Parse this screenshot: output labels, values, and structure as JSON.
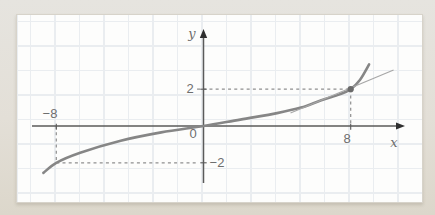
{
  "colors": {
    "background": "#e3dfd7",
    "panel": "#fdfdfc",
    "grid": "#eaedf0",
    "axis": "#5a5a5a",
    "arrow": "#2f2f2f",
    "curve": "#868686",
    "tangent": "#a7a7a7",
    "dashed": "#8f8f8f",
    "point": "#6a6a6a",
    "text": "#6e6e6e"
  },
  "chart_data": {
    "type": "line",
    "xlabel": "x",
    "ylabel": "y",
    "origin_label": "0",
    "grid": true,
    "xlim": [
      -9.3,
      11
    ],
    "ylim": [
      -3.2,
      5.3
    ],
    "x_ticks": [
      {
        "value": -8,
        "label": "−8"
      },
      {
        "value": 8,
        "label": "8"
      }
    ],
    "y_ticks": [
      {
        "value": 2,
        "label": "2"
      },
      {
        "value": -2,
        "label": "−2"
      }
    ],
    "series": [
      {
        "name": "curve",
        "style": "smooth",
        "points": [
          [
            -8.7,
            -2.55
          ],
          [
            -8,
            -2
          ],
          [
            -6.7,
            -1.45
          ],
          [
            -4.5,
            -0.8
          ],
          [
            -2.3,
            -0.35
          ],
          [
            0,
            0
          ],
          [
            2,
            0.35
          ],
          [
            4,
            0.7
          ],
          [
            5.3,
            1.0
          ],
          [
            6.4,
            1.4
          ],
          [
            7.4,
            1.72
          ],
          [
            8,
            2
          ],
          [
            8.5,
            2.5
          ],
          [
            9,
            3.35
          ]
        ]
      },
      {
        "name": "tangent-line",
        "style": "straight",
        "points": [
          [
            4.73,
            0.71
          ],
          [
            10.33,
            3.04
          ]
        ]
      }
    ],
    "marked_point": {
      "x": 8,
      "y": 2
    },
    "guide_lines": [
      {
        "from": [
          -0.35,
          2
        ],
        "to": [
          8,
          2
        ]
      },
      {
        "from": [
          8,
          2
        ],
        "to": [
          8,
          0
        ]
      },
      {
        "from": [
          -8,
          0
        ],
        "to": [
          -8,
          -2
        ]
      },
      {
        "from": [
          -8,
          -2
        ],
        "to": [
          -0.3,
          -2
        ]
      }
    ]
  }
}
